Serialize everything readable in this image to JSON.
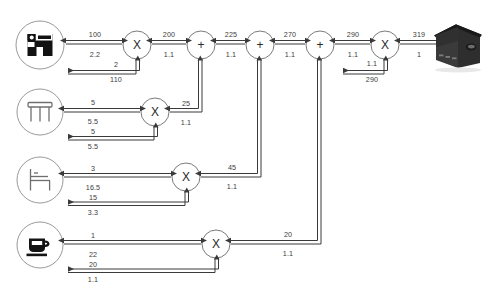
{
  "diagram": {
    "node_symbols": {
      "multiply": "X",
      "sum": "+"
    },
    "colors": {
      "line": "#3a3a3a",
      "text": "#3b3b3b",
      "node_stroke": "#6b6b6b",
      "icon_dark": "#1a1a1a",
      "icon_gray": "#8a8a8a",
      "plant_dark": "#2b2b2b",
      "background": "#ffffff"
    },
    "icons": [
      {
        "id": "armchair",
        "name": "armchair-icon",
        "cx": 40,
        "cy": 45
      },
      {
        "id": "table",
        "name": "table-icon",
        "cx": 40,
        "cy": 112
      },
      {
        "id": "chair",
        "name": "chair-icon",
        "cx": 40,
        "cy": 180
      },
      {
        "id": "cup",
        "name": "cup-icon",
        "cx": 40,
        "cy": 245
      }
    ],
    "plant": {
      "name": "factory-building",
      "cx": 460,
      "cy": 45
    },
    "nodes": [
      {
        "id": "m1",
        "symbol": "X",
        "cx": 137,
        "cy": 45,
        "r": 14
      },
      {
        "id": "m2",
        "symbol": "X",
        "cx": 155,
        "cy": 112,
        "r": 14
      },
      {
        "id": "m3",
        "symbol": "X",
        "cx": 186,
        "cy": 177,
        "r": 14
      },
      {
        "id": "m4",
        "symbol": "X",
        "cx": 216,
        "cy": 244,
        "r": 14
      },
      {
        "id": "s1",
        "symbol": "+",
        "cx": 201,
        "cy": 45,
        "r": 14
      },
      {
        "id": "s2",
        "symbol": "+",
        "cx": 260,
        "cy": 45,
        "r": 14
      },
      {
        "id": "s3",
        "symbol": "+",
        "cx": 320,
        "cy": 45,
        "r": 14
      },
      {
        "id": "m5",
        "symbol": "X",
        "cx": 385,
        "cy": 45,
        "r": 14
      }
    ],
    "edges": [
      {
        "id": "e-armchair-m1",
        "top": "100",
        "bottom": "2.2",
        "top_x": 95,
        "top_y": 31,
        "bot_x": 95,
        "bot_y": 51
      },
      {
        "id": "e-m1-s1",
        "top": "200",
        "bottom": "1.1",
        "top_x": 169,
        "top_y": 31,
        "bot_x": 169,
        "bot_y": 51
      },
      {
        "id": "e-s1-s2",
        "top": "225",
        "bottom": "1.1",
        "top_x": 231,
        "top_y": 31,
        "bot_x": 231,
        "bot_y": 51
      },
      {
        "id": "e-s2-s3",
        "top": "270",
        "bottom": "1.1",
        "top_x": 290,
        "top_y": 31,
        "bot_x": 290,
        "bot_y": 51
      },
      {
        "id": "e-s3-m5",
        "top": "290",
        "bottom": "1.1",
        "top_x": 353,
        "top_y": 31,
        "bot_x": 353,
        "bot_y": 51
      },
      {
        "id": "e-m5-plant",
        "top": "319",
        "bottom": "1",
        "top_x": 419,
        "top_y": 31,
        "bot_x": 419,
        "bot_y": 51
      },
      {
        "id": "e-m1-fb",
        "top": "2",
        "bottom": "110",
        "top_x": 116,
        "top_y": 61,
        "bot_x": 116,
        "bot_y": 76
      },
      {
        "id": "e-table-m2",
        "top": "5",
        "bottom": "5.5",
        "top_x": 93,
        "top_y": 99,
        "bot_x": 93,
        "bot_y": 118
      },
      {
        "id": "e-m2-s1",
        "top": "25",
        "bottom": "1.1",
        "top_x": 186,
        "top_y": 100,
        "bot_x": 186,
        "bot_y": 119
      },
      {
        "id": "e-m2-fb",
        "top": "5",
        "bottom": "5.5",
        "top_x": 93,
        "top_y": 128,
        "bot_x": 93,
        "bot_y": 143
      },
      {
        "id": "e-chair-m3",
        "top": "3",
        "bottom": "16.5",
        "top_x": 93,
        "top_y": 165,
        "bot_x": 93,
        "bot_y": 184
      },
      {
        "id": "e-m3-s2",
        "top": "45",
        "bottom": "1.1",
        "top_x": 232,
        "top_y": 164,
        "bot_x": 232,
        "bot_y": 183
      },
      {
        "id": "e-m3-fb",
        "top": "15",
        "bottom": "3.3",
        "top_x": 93,
        "top_y": 194,
        "bot_x": 93,
        "bot_y": 209
      },
      {
        "id": "e-cup-m4",
        "top": "1",
        "bottom": "22",
        "top_x": 93,
        "top_y": 232,
        "bot_x": 93,
        "bot_y": 251
      },
      {
        "id": "e-m4-s3",
        "top": "20",
        "bottom": "1.1",
        "top_x": 288,
        "top_y": 231,
        "bot_x": 288,
        "bot_y": 250
      },
      {
        "id": "e-m4-fb",
        "top": "20",
        "bottom": "1.1",
        "top_x": 93,
        "top_y": 261,
        "bot_x": 93,
        "bot_y": 276
      },
      {
        "id": "e-m5-fb",
        "top": "1.1",
        "bottom": "290",
        "top_x": 372,
        "top_y": 60,
        "bot_x": 372,
        "bot_y": 76
      }
    ]
  }
}
